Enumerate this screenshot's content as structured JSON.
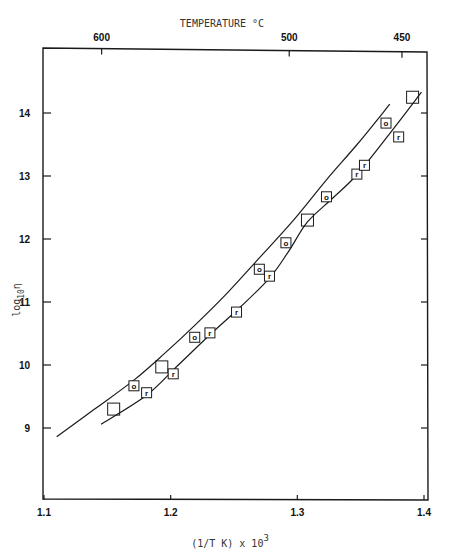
{
  "chart_data": {
    "type": "scatter",
    "title": "",
    "xlabel": "(1/T K) x 10^3",
    "xlabel_main": "(1/T K) x 10",
    "xlabel_sup": "3",
    "ylabel": "log10 η",
    "ylabel_main": "log",
    "ylabel_sub": "10",
    "ylabel_sym": "η",
    "top_axis_label": "TEMPERATURE °C",
    "xlim": [
      1.1,
      1.4
    ],
    "ylim": [
      8.0,
      14.6
    ],
    "x_ticks": [
      1.1,
      1.2,
      1.3,
      1.4
    ],
    "x_tick_labels": [
      "1.1",
      "1.2",
      "1.3",
      "1.4"
    ],
    "y_ticks": [
      9,
      10,
      11,
      12,
      13,
      14
    ],
    "y_tick_labels": [
      "9",
      "10",
      "11",
      "12",
      "13",
      "14"
    ],
    "top_ticks": [
      {
        "label": "600",
        "x": 1.1455
      },
      {
        "label": "500",
        "x": 1.2936
      },
      {
        "label": "450",
        "x": 1.3826
      }
    ],
    "grid": false,
    "legend": null,
    "series": [
      {
        "name": "blank-square",
        "marker": "square",
        "label": "",
        "points": [
          [
            1.155,
            9.3
          ],
          [
            1.193,
            9.97
          ],
          [
            1.308,
            12.3
          ],
          [
            1.391,
            14.25
          ]
        ]
      },
      {
        "name": "o",
        "marker": "square",
        "label": "o",
        "points": [
          [
            1.171,
            9.67
          ],
          [
            1.219,
            10.44
          ],
          [
            1.27,
            11.52
          ],
          [
            1.291,
            11.94
          ],
          [
            1.323,
            12.67
          ],
          [
            1.37,
            13.84
          ]
        ]
      },
      {
        "name": "r",
        "marker": "square",
        "label": "r",
        "points": [
          [
            1.181,
            9.56
          ],
          [
            1.202,
            9.86
          ],
          [
            1.231,
            10.51
          ],
          [
            1.252,
            10.84
          ],
          [
            1.278,
            11.41
          ],
          [
            1.347,
            13.03
          ],
          [
            1.353,
            13.17
          ],
          [
            1.38,
            13.62
          ]
        ]
      }
    ],
    "curves": [
      {
        "name": "upper-fit-curve",
        "points": [
          [
            1.11,
            8.86
          ],
          [
            1.14,
            9.3
          ],
          [
            1.171,
            9.76
          ],
          [
            1.195,
            10.18
          ],
          [
            1.219,
            10.63
          ],
          [
            1.245,
            11.15
          ],
          [
            1.27,
            11.7
          ],
          [
            1.297,
            12.3
          ],
          [
            1.323,
            12.94
          ],
          [
            1.348,
            13.52
          ],
          [
            1.373,
            14.14
          ]
        ]
      },
      {
        "name": "lower-fit-curve",
        "points": [
          [
            1.145,
            9.06
          ],
          [
            1.181,
            9.52
          ],
          [
            1.205,
            9.98
          ],
          [
            1.231,
            10.48
          ],
          [
            1.255,
            10.92
          ],
          [
            1.278,
            11.38
          ],
          [
            1.293,
            11.8
          ],
          [
            1.308,
            12.27
          ],
          [
            1.328,
            12.65
          ],
          [
            1.347,
            13.02
          ],
          [
            1.372,
            13.65
          ],
          [
            1.398,
            14.33
          ]
        ]
      }
    ]
  }
}
